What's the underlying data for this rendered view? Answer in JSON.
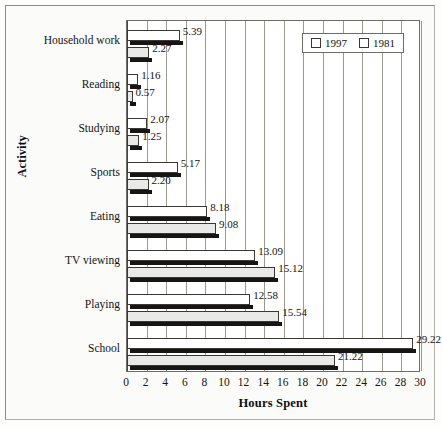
{
  "chart_data": {
    "type": "bar",
    "orientation": "horizontal",
    "title": "",
    "xlabel": "Hours Spent",
    "ylabel": "Activity",
    "xlim": [
      0,
      30
    ],
    "xticks": [
      0,
      2,
      4,
      6,
      8,
      10,
      12,
      14,
      16,
      18,
      20,
      22,
      24,
      26,
      28,
      30
    ],
    "grid": true,
    "grid_axis": "x",
    "legend_position": "top-right",
    "categories": [
      "Household work",
      "Reading",
      "Studying",
      "Sports",
      "Eating",
      "TV viewing",
      "Playing",
      "School"
    ],
    "series": [
      {
        "name": "1997",
        "color": "#ffffff",
        "values": [
          5.39,
          1.16,
          2.07,
          5.17,
          8.18,
          13.09,
          12.58,
          29.22
        ],
        "labels": [
          "5.39",
          "1.16",
          "2.07",
          "5.17",
          "8.18",
          "13.09",
          "12.58",
          "29.22"
        ]
      },
      {
        "name": "1981",
        "color": "#e9e9e7",
        "values": [
          2.27,
          0.57,
          1.25,
          2.2,
          9.08,
          15.12,
          15.54,
          21.22
        ],
        "labels": [
          "2.27",
          "0.57",
          "1.25",
          "2.20",
          "9.08",
          "15.12",
          "15.54",
          "21.22"
        ]
      }
    ]
  },
  "legend": {
    "items": [
      {
        "label": "1997",
        "swatch": "#ffffff"
      },
      {
        "label": "1981",
        "swatch": "#ffffff"
      }
    ]
  },
  "axes": {
    "x_title": "Hours Spent",
    "y_title": "Activity"
  }
}
